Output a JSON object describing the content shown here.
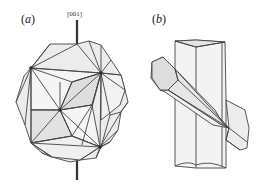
{
  "panels": [
    {
      "id": "a",
      "label_open": "(",
      "label_letter": "a",
      "label_close": ")",
      "axis_label": "[001]"
    },
    {
      "id": "b",
      "label_open": "(",
      "label_letter": "b",
      "label_close": ")"
    }
  ],
  "colors": {
    "stroke": "#444444",
    "fill": "#e9e9e9",
    "fill_light": "#f4f4f4",
    "fill_dark": "#dcdcdc",
    "axis": "#333333"
  }
}
